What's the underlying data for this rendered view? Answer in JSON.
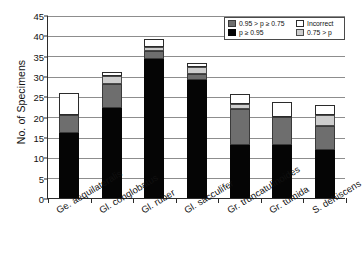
{
  "chart_data": {
    "type": "bar",
    "subtype": "stacked",
    "title": "",
    "xlabel": "",
    "ylabel": "No. of Specimens",
    "ylim": [
      0,
      45
    ],
    "ytick_step": 5,
    "yticks": [
      0,
      5,
      10,
      15,
      20,
      25,
      30,
      35,
      40,
      45
    ],
    "grid": true,
    "legend_position": "top-right",
    "categories": [
      "Ge. aequilateralis",
      "Gl. conglobatus",
      "Gl. ruber",
      "Gl. sacculifer",
      "Gr. truncatulinoides",
      "Gr. tumida",
      "S. dehiscens"
    ],
    "series": [
      {
        "name": "p ≥ 0.95",
        "color": "#050505",
        "values": [
          16.0,
          22.2,
          34.2,
          29.0,
          13.0,
          13.0,
          11.9
        ]
      },
      {
        "name": "0.95 > p ≥ 0.75",
        "color": "#6e6e6e",
        "values": [
          4.3,
          5.9,
          2.0,
          1.5,
          9.0,
          7.0,
          5.7
        ]
      },
      {
        "name": "0.75 > p",
        "color": "#cdcdcd",
        "values": [
          0.0,
          2.0,
          1.0,
          1.6,
          1.0,
          0.0,
          2.7
        ]
      },
      {
        "name": "Incorrect",
        "color": "#ffffff",
        "values": [
          5.6,
          1.0,
          1.8,
          1.0,
          2.7,
          3.7,
          2.5
        ]
      }
    ],
    "totals": [
      25.9,
      31.1,
      39.0,
      33.1,
      25.7,
      23.7,
      22.8
    ]
  },
  "legend": {
    "entries": [
      {
        "label": "0.95 > p ≥ 0.75",
        "swatch": "sw-dark"
      },
      {
        "label": "Incorrect",
        "swatch": "sw-white"
      },
      {
        "label": "p ≥ 0.95",
        "swatch": "sw-black"
      },
      {
        "label": "0.75 > p",
        "swatch": "sw-light"
      }
    ]
  }
}
